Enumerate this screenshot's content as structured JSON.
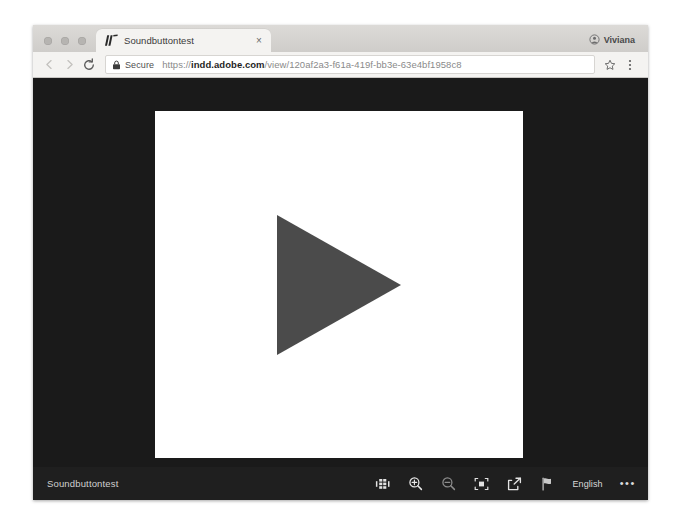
{
  "browser": {
    "window_controls": [
      "close",
      "minimize",
      "maximize"
    ],
    "tab": {
      "title": "Soundbuttontest",
      "favicon_name": "adobe-indesign-favicon",
      "close_label": "×"
    },
    "profile": {
      "name": "Viviana",
      "icon_name": "profile-avatar-icon"
    },
    "toolbar": {
      "back_label": "Back",
      "forward_label": "Forward",
      "reload_label": "Reload",
      "bookmark_label": "Bookmark this page",
      "menu_label": "Customize and control Google Chrome"
    },
    "omnibox": {
      "security_label": "Secure",
      "lock_icon": "lock-icon",
      "url_scheme": "https://",
      "url_host": "indd.adobe.com",
      "url_path": "/view/120af2a3-f61a-419f-bb3e-63e4bf1958c8",
      "url_full": "https://indd.adobe.com/view/120af2a3-f61a-419f-bb3e-63e4bf1958c8",
      "placeholder": "Search Google or type a URL"
    }
  },
  "viewer": {
    "document_name": "Soundbuttontest",
    "page": {
      "play_button_label": "Play",
      "play_icon_color": "#4b4b4b",
      "background_color": "#ffffff"
    },
    "stage_background": "#1a1a1a",
    "toolbar": {
      "background": "#1f1f1f",
      "buttons": [
        {
          "name": "page-thumbnails-button",
          "icon": "grid-pages-icon",
          "label": "Pages"
        },
        {
          "name": "zoom-in-button",
          "icon": "magnifier-plus-icon",
          "label": "Zoom in"
        },
        {
          "name": "zoom-out-button",
          "icon": "magnifier-minus-icon",
          "label": "Zoom out"
        },
        {
          "name": "fit-page-button",
          "icon": "fit-screen-icon",
          "label": "Fit page"
        },
        {
          "name": "share-button",
          "icon": "share-icon",
          "label": "Share"
        },
        {
          "name": "language-button",
          "icon": "flag-icon",
          "label": "Language"
        }
      ],
      "language": "English",
      "more_label": "•••"
    }
  }
}
